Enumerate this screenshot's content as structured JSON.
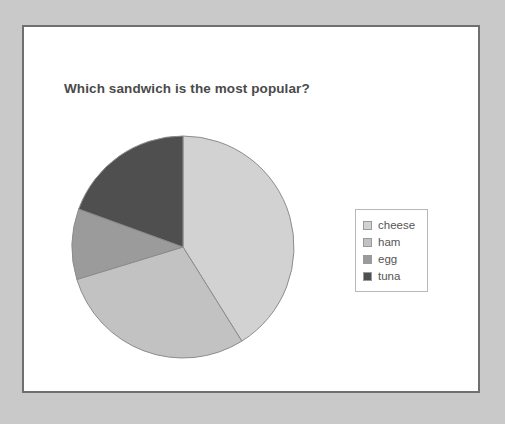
{
  "chart_data": {
    "type": "pie",
    "title": "Which sandwich is the most popular?",
    "xlabel": "",
    "ylabel": "",
    "legend_position": "right",
    "grid": false,
    "categories": [
      "cheese",
      "ham",
      "egg",
      "tuna"
    ],
    "values": [
      41,
      29,
      10,
      20
    ],
    "unit": "percent",
    "slice_angles_deg": [
      148,
      105,
      37,
      70
    ],
    "start_angle_deg": 0,
    "direction": "clockwise",
    "colors": [
      "#d2d2d2",
      "#c2c2c2",
      "#9b9b9b",
      "#4f4f4f"
    ],
    "slice_border_color": "#8c8c8c",
    "legend": [
      {
        "label": "cheese",
        "color": "#d2d2d2"
      },
      {
        "label": "ham",
        "color": "#c2c2c2"
      },
      {
        "label": "egg",
        "color": "#9b9b9b"
      },
      {
        "label": "tuna",
        "color": "#4f4f4f"
      }
    ]
  },
  "page": {
    "background_color": "#c9c9c9",
    "frame_border_color": "#6f6f6f",
    "frame_background": "#ffffff",
    "title_color": "#4a4a4a",
    "legend_border_color": "#b8b8b8",
    "legend_text_color": "#555555"
  }
}
